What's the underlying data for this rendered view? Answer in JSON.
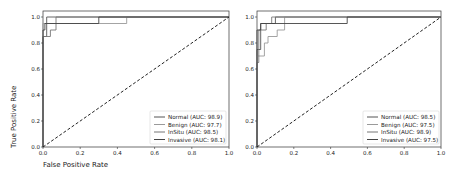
{
  "chart_data": [
    {
      "type": "line",
      "title": "",
      "xlabel": "False Positive Rate",
      "ylabel": "True Positive Rate",
      "xlim": [
        0.0,
        1.0
      ],
      "ylim": [
        0.0,
        1.0
      ],
      "xticks": [
        "0.0",
        "0.2",
        "0.4",
        "0.6",
        "0.8",
        "1.0"
      ],
      "yticks": [
        "0.0",
        "0.2",
        "0.4",
        "0.6",
        "0.8",
        "1.0"
      ],
      "grid": false,
      "legend_position": "lower right",
      "series": [
        {
          "name": "Normal (AUC: 98.9)",
          "color": "#555555",
          "x": [
            0.0,
            0.0,
            0.02,
            0.02,
            1.0
          ],
          "y": [
            0.0,
            0.85,
            0.85,
            1.0,
            1.0
          ]
        },
        {
          "name": "Benign (AUC: 97.7)",
          "color": "#9a9a9a",
          "x": [
            0.0,
            0.0,
            0.0,
            0.07,
            0.07,
            0.45,
            0.45,
            1.0
          ],
          "y": [
            0.0,
            0.9,
            0.95,
            0.95,
            0.95,
            0.95,
            1.0,
            1.0
          ]
        },
        {
          "name": "InSitu (AUC: 98.5)",
          "color": "#777777",
          "x": [
            0.0,
            0.0,
            0.04,
            0.04,
            0.07,
            0.07,
            1.0
          ],
          "y": [
            0.0,
            0.85,
            0.85,
            0.9,
            0.9,
            1.0,
            1.0
          ]
        },
        {
          "name": "Invasive (AUC: 98.1)",
          "color": "#444444",
          "x": [
            0.0,
            0.0,
            0.01,
            0.01,
            0.3,
            0.3,
            1.0
          ],
          "y": [
            0.0,
            0.9,
            0.9,
            0.95,
            0.95,
            1.0,
            1.0
          ]
        },
        {
          "name": "chance",
          "color": "#222222",
          "style": "dashed",
          "x": [
            0.0,
            1.0
          ],
          "y": [
            0.0,
            1.0
          ]
        }
      ]
    },
    {
      "type": "line",
      "title": "",
      "xlabel": "",
      "ylabel": "",
      "xlim": [
        0.0,
        1.0
      ],
      "ylim": [
        0.0,
        1.0
      ],
      "xticks": [
        "0.0",
        "0.2",
        "0.4",
        "0.6",
        "0.8",
        "1.0"
      ],
      "yticks": [
        "0.0",
        "0.2",
        "0.4",
        "0.6",
        "0.8",
        "1.0"
      ],
      "grid": false,
      "legend_position": "lower right",
      "series": [
        {
          "name": "Normal (AUC: 98.5)",
          "color": "#555555",
          "x": [
            0.0,
            0.0,
            0.02,
            0.02,
            0.1,
            0.1,
            1.0
          ],
          "y": [
            0.0,
            0.75,
            0.75,
            0.95,
            0.95,
            1.0,
            1.0
          ]
        },
        {
          "name": "Benign (AUC: 97.5)",
          "color": "#9a9a9a",
          "x": [
            0.0,
            0.0,
            0.04,
            0.04,
            0.06,
            0.06,
            0.11,
            0.11,
            0.15,
            0.15,
            1.0
          ],
          "y": [
            0.0,
            0.7,
            0.7,
            0.8,
            0.8,
            0.85,
            0.85,
            0.9,
            0.9,
            1.0,
            1.0
          ]
        },
        {
          "name": "InSitu (AUC: 98.9)",
          "color": "#777777",
          "x": [
            0.0,
            0.0,
            0.01,
            0.01,
            0.05,
            0.05,
            0.08,
            0.08,
            1.0
          ],
          "y": [
            0.0,
            0.65,
            0.65,
            0.9,
            0.9,
            0.95,
            0.95,
            1.0,
            1.0
          ]
        },
        {
          "name": "Invasive (AUC: 97.5)",
          "color": "#444444",
          "x": [
            0.0,
            0.0,
            0.02,
            0.02,
            0.49,
            0.49,
            1.0
          ],
          "y": [
            0.0,
            0.9,
            0.9,
            0.95,
            0.95,
            1.0,
            1.0
          ]
        },
        {
          "name": "chance",
          "color": "#222222",
          "style": "dashed",
          "x": [
            0.0,
            1.0
          ],
          "y": [
            0.0,
            1.0
          ]
        }
      ]
    }
  ],
  "plots": [
    {
      "xlabel": "False Positive Rate",
      "ylabel": "True Positive Rate",
      "ticks": [
        "0.0",
        "0.2",
        "0.4",
        "0.6",
        "0.8",
        "1.0"
      ],
      "legend": [
        "Normal (AUC: 98.9)",
        "Benign (AUC: 97.7)",
        "InSitu (AUC: 98.5)",
        "Invasive (AUC: 98.1)"
      ]
    },
    {
      "ticks": [
        "0.0",
        "0.2",
        "0.4",
        "0.6",
        "0.8",
        "1.0"
      ],
      "legend": [
        "Normal (AUC: 98.5)",
        "Benign (AUC: 97.5)",
        "InSitu (AUC: 98.9)",
        "Invasive (AUC: 97.5)"
      ]
    }
  ]
}
